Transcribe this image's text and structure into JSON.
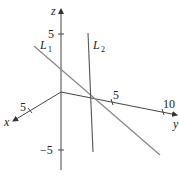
{
  "diagram": {
    "type": "3d-axes-with-lines",
    "colors": {
      "axes": "#444444",
      "line_L1": "#888888",
      "line_L2": "#555555",
      "text": "#222222"
    },
    "axes": {
      "z": {
        "label": "z",
        "ticks": [
          {
            "label": "5"
          },
          {
            "label": "−5"
          }
        ]
      },
      "x": {
        "label": "x",
        "ticks": [
          {
            "label": "5"
          }
        ]
      },
      "y": {
        "label": "y",
        "ticks": [
          {
            "label": "5"
          },
          {
            "label": "10"
          }
        ]
      }
    },
    "lines": [
      {
        "name": "L",
        "subscript": "1"
      },
      {
        "name": "L",
        "subscript": "2"
      }
    ]
  }
}
